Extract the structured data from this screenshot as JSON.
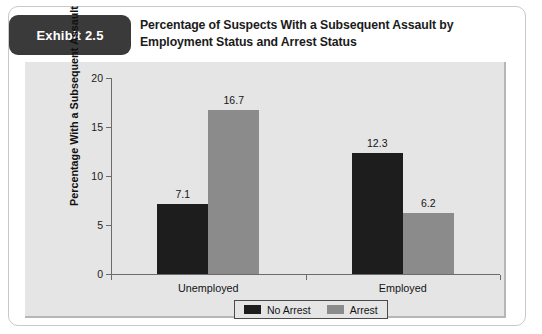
{
  "exhibit": {
    "badge_label": "Exhibit 2.5",
    "title": "Percentage of Suspects With a Subsequent Assault by Employment Status and Arrest Status"
  },
  "colors": {
    "badge_background": "#3a3a3a",
    "plot_background": "#e5e5e5",
    "no_arrest_bar": "#1d1d1d",
    "arrest_bar": "#8b8b8b",
    "axis": "#6b6b6b"
  },
  "chart_data": {
    "type": "bar",
    "title": "Percentage of Suspects With a Subsequent Assault by Employment Status and Arrest Status",
    "xlabel": "",
    "ylabel": "Percentage With a Subsequent Assault",
    "categories": [
      "Unemployed",
      "Employed"
    ],
    "series": [
      {
        "name": "No Arrest",
        "values": [
          7.1,
          12.3
        ],
        "color": "#1d1d1d"
      },
      {
        "name": "Arrest",
        "values": [
          16.7,
          6.2
        ],
        "color": "#8b8b8b"
      }
    ],
    "value_labels": [
      "7.1",
      "16.7",
      "12.3",
      "6.2"
    ],
    "ylim": [
      0,
      20
    ],
    "yticks": [
      0,
      5,
      10,
      15,
      20
    ],
    "ytick_labels": [
      "0",
      "5",
      "10",
      "15",
      "20"
    ],
    "grid": false,
    "legend_position": "bottom-center",
    "legend": [
      "No Arrest",
      "Arrest"
    ]
  }
}
